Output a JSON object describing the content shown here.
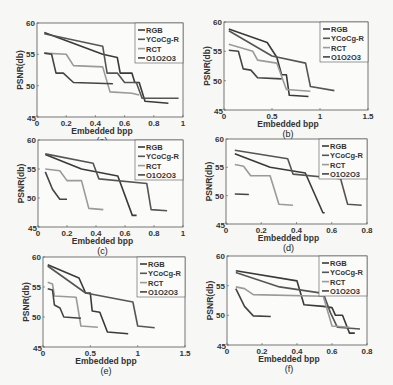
{
  "figure": {
    "legend_labels": [
      "RGB",
      "YCoCg-R",
      "RCT",
      "O1O2O3"
    ]
  },
  "chart_data": [
    {
      "type": "line",
      "panel": "(a)",
      "caption": "(a)",
      "xlabel": "Embedded bpp",
      "ylabel": "PSNR(db)",
      "xlim": [
        0,
        1
      ],
      "ylim": [
        45,
        60
      ],
      "xticks": [
        0,
        0.2,
        0.4,
        0.6,
        0.8,
        1
      ],
      "xtick_labels": [
        "0",
        "0.2",
        "0.4",
        "0.6",
        "0.8",
        "1"
      ],
      "yticks": [
        45,
        50,
        55,
        60
      ],
      "legend": [
        "RGB",
        "YCoCg-R",
        "RCT",
        "O1O2O3"
      ],
      "box": {
        "x": 37,
        "y": 23,
        "w": 146,
        "h": 94
      },
      "series": [
        {
          "name": "RGB",
          "color": "#3a3a3a",
          "points": [
            [
              0.05,
              58.5
            ],
            [
              0.45,
              55.0
            ],
            [
              0.55,
              54.5
            ],
            [
              0.57,
              52.0
            ],
            [
              0.65,
              52.0
            ],
            [
              0.67,
              50.5
            ],
            [
              0.7,
              50.5
            ],
            [
              0.74,
              47.5
            ],
            [
              0.9,
              47.2
            ]
          ]
        },
        {
          "name": "YCoCg-R",
          "color": "#555555",
          "points": [
            [
              0.05,
              58.3
            ],
            [
              0.45,
              56.3
            ],
            [
              0.48,
              52.0
            ],
            [
              0.55,
              52.0
            ],
            [
              0.6,
              50.5
            ],
            [
              0.68,
              50.5
            ],
            [
              0.72,
              48.0
            ],
            [
              0.97,
              48.0
            ]
          ]
        },
        {
          "name": "RCT",
          "color": "#9a9a9a",
          "points": [
            [
              0.05,
              55.2
            ],
            [
              0.2,
              55.0
            ],
            [
              0.25,
              53.2
            ],
            [
              0.45,
              53.0
            ],
            [
              0.5,
              49.0
            ],
            [
              0.65,
              48.8
            ],
            [
              0.7,
              48.5
            ]
          ]
        },
        {
          "name": "O1O2O3",
          "color": "#444444",
          "points": [
            [
              0.05,
              55.2
            ],
            [
              0.1,
              55.0
            ],
            [
              0.13,
              52.0
            ],
            [
              0.18,
              52.0
            ],
            [
              0.25,
              50.5
            ],
            [
              0.52,
              50.3
            ]
          ]
        }
      ]
    },
    {
      "type": "line",
      "panel": "(b)",
      "caption": "(b)",
      "xlabel": "Embedded bpp",
      "ylabel": "PSNR(db)",
      "xlim": [
        0,
        1.5
      ],
      "ylim": [
        45,
        60
      ],
      "xticks": [
        0,
        0.5,
        1,
        1.5
      ],
      "xtick_labels": [
        "0",
        "0.5",
        "1",
        "1.5"
      ],
      "yticks": [
        45,
        50,
        55,
        60
      ],
      "legend": [
        "RGB",
        "YCoCg-R",
        "RCT",
        "O1O2O3"
      ],
      "box": {
        "x": 224,
        "y": 22,
        "w": 144,
        "h": 88
      },
      "series": [
        {
          "name": "RGB",
          "color": "#3a3a3a",
          "points": [
            [
              0.05,
              58.8
            ],
            [
              0.45,
              56.5
            ],
            [
              0.55,
              54.0
            ],
            [
              0.6,
              51.0
            ],
            [
              0.65,
              51.0
            ],
            [
              0.68,
              47.5
            ],
            [
              0.88,
              47.3
            ]
          ]
        },
        {
          "name": "YCoCg-R",
          "color": "#555555",
          "points": [
            [
              0.05,
              58.5
            ],
            [
              0.5,
              54.2
            ],
            [
              0.85,
              53.0
            ],
            [
              0.9,
              49.0
            ],
            [
              1.15,
              48.3
            ]
          ]
        },
        {
          "name": "RCT",
          "color": "#9a9a9a",
          "points": [
            [
              0.05,
              56.2
            ],
            [
              0.3,
              55.0
            ],
            [
              0.35,
              53.5
            ],
            [
              0.55,
              53.0
            ],
            [
              0.65,
              48.5
            ],
            [
              0.9,
              48.2
            ]
          ]
        },
        {
          "name": "O1O2O3",
          "color": "#444444",
          "points": [
            [
              0.05,
              55.2
            ],
            [
              0.15,
              55.0
            ],
            [
              0.2,
              52.0
            ],
            [
              0.28,
              51.8
            ],
            [
              0.35,
              50.5
            ],
            [
              0.6,
              50.3
            ]
          ]
        }
      ]
    },
    {
      "type": "line",
      "panel": "(c)",
      "caption": "(c)",
      "xlabel": "Embedded bpp",
      "ylabel": "PSNR(db)",
      "xlim": [
        0,
        1
      ],
      "ylim": [
        45,
        60
      ],
      "xticks": [
        0,
        0.2,
        0.4,
        0.6,
        0.8,
        1
      ],
      "xtick_labels": [
        "0",
        "0.2",
        "0.4",
        "0.6",
        "0.8",
        "1"
      ],
      "yticks": [
        45,
        50,
        55,
        60
      ],
      "legend": [
        "RGB",
        "YCoCg-R",
        "RCT",
        "O1O2O3"
      ],
      "box": {
        "x": 38,
        "y": 140,
        "w": 145,
        "h": 87
      },
      "series": [
        {
          "name": "RGB",
          "color": "#3a3a3a",
          "points": [
            [
              0.05,
              57.5
            ],
            [
              0.3,
              55.0
            ],
            [
              0.55,
              53.8
            ],
            [
              0.65,
              47.0
            ],
            [
              0.68,
              47.0
            ]
          ]
        },
        {
          "name": "YCoCg-R",
          "color": "#555555",
          "points": [
            [
              0.05,
              57.6
            ],
            [
              0.38,
              56.0
            ],
            [
              0.42,
              53.3
            ],
            [
              0.75,
              52.5
            ],
            [
              0.78,
              48.0
            ],
            [
              0.89,
              47.8
            ]
          ]
        },
        {
          "name": "RCT",
          "color": "#9a9a9a",
          "points": [
            [
              0.05,
              55.0
            ],
            [
              0.15,
              54.7
            ],
            [
              0.2,
              53.0
            ],
            [
              0.3,
              53.0
            ],
            [
              0.35,
              48.2
            ],
            [
              0.45,
              48.0
            ]
          ]
        },
        {
          "name": "O1O2O3",
          "color": "#444444",
          "points": [
            [
              0.05,
              54.5
            ],
            [
              0.1,
              51.5
            ],
            [
              0.15,
              49.8
            ],
            [
              0.2,
              49.8
            ]
          ]
        }
      ]
    },
    {
      "type": "line",
      "panel": "(d)",
      "caption": "(d)",
      "xlabel": "Embedded bpp",
      "ylabel": "PSNR(db)",
      "xlim": [
        0,
        0.8
      ],
      "ylim": [
        45,
        60
      ],
      "xticks": [
        0,
        0.2,
        0.4,
        0.6,
        0.8
      ],
      "xtick_labels": [
        "0",
        "0.2",
        "0.4",
        "0.6",
        "0.8"
      ],
      "yticks": [
        45,
        50,
        55,
        60
      ],
      "legend": [
        "RGB",
        "YCoCg-R",
        "RCT",
        "O1O2O3"
      ],
      "box": {
        "x": 226,
        "y": 139,
        "w": 141,
        "h": 85
      },
      "series": [
        {
          "name": "RGB",
          "color": "#3a3a3a",
          "points": [
            [
              0.05,
              57.4
            ],
            [
              0.25,
              55.0
            ],
            [
              0.45,
              54.0
            ],
            [
              0.55,
              47.0
            ],
            [
              0.56,
              47.0
            ]
          ]
        },
        {
          "name": "YCoCg-R",
          "color": "#555555",
          "points": [
            [
              0.05,
              58.0
            ],
            [
              0.35,
              56.5
            ],
            [
              0.38,
              53.8
            ],
            [
              0.65,
              53.0
            ],
            [
              0.69,
              48.5
            ],
            [
              0.77,
              48.3
            ]
          ]
        },
        {
          "name": "RCT",
          "color": "#9a9a9a",
          "points": [
            [
              0.05,
              55.5
            ],
            [
              0.1,
              55.2
            ],
            [
              0.14,
              53.5
            ],
            [
              0.25,
              53.5
            ],
            [
              0.3,
              48.5
            ],
            [
              0.38,
              48.3
            ]
          ]
        },
        {
          "name": "O1O2O3",
          "color": "#444444",
          "points": [
            [
              0.05,
              50.3
            ],
            [
              0.13,
              50.2
            ]
          ]
        }
      ]
    },
    {
      "type": "line",
      "panel": "(e)",
      "caption": "(e)",
      "xlabel": "Embedded bpp",
      "ylabel": "PSNR(db)",
      "xlim": [
        0,
        1.5
      ],
      "ylim": [
        45,
        60
      ],
      "xticks": [
        0,
        0.5,
        1,
        1.5
      ],
      "xtick_labels": [
        "0",
        "0.5",
        "1",
        "1.5"
      ],
      "yticks": [
        45,
        50,
        55,
        60
      ],
      "legend": [
        "RGB",
        "YCoCg-R",
        "RCT",
        "O1O2O3"
      ],
      "box": {
        "x": 43,
        "y": 257,
        "w": 142,
        "h": 90
      },
      "series": [
        {
          "name": "RGB",
          "color": "#3a3a3a",
          "points": [
            [
              0.05,
              58.7
            ],
            [
              0.38,
              56.5
            ],
            [
              0.45,
              54.0
            ],
            [
              0.5,
              54.0
            ],
            [
              0.52,
              51.0
            ],
            [
              0.6,
              50.8
            ],
            [
              0.68,
              47.5
            ],
            [
              0.9,
              47.2
            ]
          ]
        },
        {
          "name": "YCoCg-R",
          "color": "#555555",
          "points": [
            [
              0.05,
              58.5
            ],
            [
              0.45,
              54.0
            ],
            [
              0.95,
              52.5
            ],
            [
              1.0,
              48.5
            ],
            [
              1.18,
              48.2
            ]
          ]
        },
        {
          "name": "RCT",
          "color": "#9a9a9a",
          "points": [
            [
              0.05,
              55.8
            ],
            [
              0.1,
              55.5
            ],
            [
              0.12,
              53.5
            ],
            [
              0.35,
              53.3
            ],
            [
              0.4,
              48.5
            ],
            [
              0.58,
              48.3
            ]
          ]
        },
        {
          "name": "O1O2O3",
          "color": "#444444",
          "points": [
            [
              0.05,
              54.7
            ],
            [
              0.1,
              54.5
            ],
            [
              0.12,
              52.0
            ],
            [
              0.18,
              51.5
            ],
            [
              0.22,
              50.0
            ],
            [
              0.4,
              49.8
            ]
          ]
        }
      ]
    },
    {
      "type": "line",
      "panel": "(f)",
      "caption": "(f)",
      "xlabel": "Embedded bpp",
      "ylabel": "PSNR(db)",
      "xlim": [
        0,
        0.8
      ],
      "ylim": [
        45,
        60
      ],
      "xticks": [
        0,
        0.2,
        0.4,
        0.6,
        0.8
      ],
      "xtick_labels": [
        "0",
        "0.2",
        "0.4",
        "0.6",
        "0.8"
      ],
      "yticks": [
        45,
        50,
        55,
        60
      ],
      "legend": [
        "RGB",
        "YCoCg-R",
        "RCT",
        "O1O2O3"
      ],
      "box": {
        "x": 227,
        "y": 256,
        "w": 140,
        "h": 89
      },
      "series": [
        {
          "name": "RGB",
          "color": "#3a3a3a",
          "points": [
            [
              0.05,
              57.5
            ],
            [
              0.4,
              55.8
            ],
            [
              0.44,
              51.8
            ],
            [
              0.55,
              51.5
            ],
            [
              0.6,
              51.3
            ],
            [
              0.62,
              50.0
            ],
            [
              0.66,
              50.0
            ],
            [
              0.7,
              47.0
            ],
            [
              0.73,
              47.0
            ]
          ]
        },
        {
          "name": "YCoCg-R",
          "color": "#555555",
          "points": [
            [
              0.05,
              57.2
            ],
            [
              0.3,
              54.8
            ],
            [
              0.55,
              53.7
            ],
            [
              0.59,
              50.5
            ],
            [
              0.63,
              48.0
            ],
            [
              0.76,
              47.7
            ]
          ]
        },
        {
          "name": "RCT",
          "color": "#9a9a9a",
          "points": [
            [
              0.05,
              54.8
            ],
            [
              0.1,
              54.5
            ],
            [
              0.15,
              53.5
            ],
            [
              0.55,
              53.2
            ],
            [
              0.6,
              48.2
            ],
            [
              0.7,
              48.0
            ]
          ]
        },
        {
          "name": "O1O2O3",
          "color": "#444444",
          "points": [
            [
              0.05,
              54.5
            ],
            [
              0.1,
              51.5
            ],
            [
              0.15,
              49.9
            ],
            [
              0.25,
              49.8
            ]
          ]
        }
      ]
    }
  ]
}
